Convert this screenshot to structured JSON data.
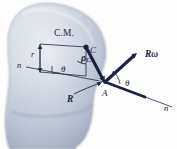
{
  "figure": {
    "type": "mechanics-rigid-body-diagram",
    "background_color": "#fdfdfd",
    "body_fill_color": "#b9c2d2",
    "body_edge_color": "#8e99ad",
    "ink_color": "#1c2440"
  },
  "labels": {
    "center_of_mass": "C.M.",
    "point_c": "C",
    "point_a": "A",
    "radius_small": "r",
    "vector_rho": "ρ",
    "vector_rho_sub": "CA",
    "vector_R": "R",
    "vector_Romega": "Rω",
    "axis_n_left": "n",
    "axis_n_right": "n",
    "angle_theta_left": "θ",
    "angle_theta_right": "θ"
  },
  "geometry": {
    "point_C": [
      86,
      47
    ],
    "point_A": [
      105,
      82
    ],
    "romega_tip": [
      137,
      53
    ],
    "axis_left_start": [
      26,
      67
    ],
    "axis_right_end": [
      172,
      107
    ],
    "right_angle_mark": [
      57,
      69
    ],
    "r_arrow_top": [
      40,
      46
    ],
    "r_arrow_bottom": [
      40,
      72
    ]
  }
}
